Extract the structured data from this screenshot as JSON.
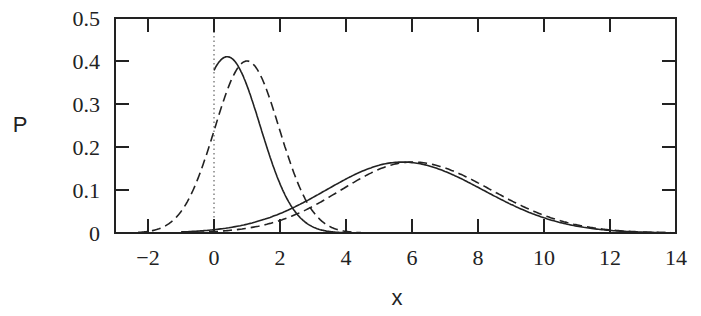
{
  "chart_data": {
    "type": "line",
    "title": "",
    "xlabel": "x",
    "ylabel": "P",
    "xlim": [
      -3,
      14
    ],
    "ylim": [
      0,
      0.5
    ],
    "grid": false,
    "legend": null,
    "x_ticks": [
      "-2",
      "0",
      "2",
      "4",
      "6",
      "8",
      "10",
      "12",
      "14"
    ],
    "y_ticks": [
      "0",
      "0.1",
      "0.2",
      "0.3",
      "0.4",
      "0.5"
    ],
    "vertical_reference_line": {
      "x": 0,
      "style": "dotted"
    },
    "series": [
      {
        "name": "solid-narrow",
        "style": "solid",
        "peak_x": 0.4,
        "peak_y": 0.41,
        "x": [
          0,
          0.4,
          1,
          2,
          3,
          4,
          5,
          6
        ],
        "y": [
          0.38,
          0.41,
          0.37,
          0.22,
          0.08,
          0.02,
          0.004,
          0.0
        ]
      },
      {
        "name": "dashed-narrow",
        "style": "dashed",
        "peak_x": 1.0,
        "peak_y": 0.4,
        "x": [
          -2,
          -1,
          0,
          1,
          2,
          3,
          4
        ],
        "y": [
          0.0,
          0.06,
          0.24,
          0.4,
          0.28,
          0.07,
          0.005
        ]
      },
      {
        "name": "solid-wide",
        "style": "solid",
        "peak_x": 5.7,
        "peak_y": 0.165,
        "x": [
          0,
          2,
          4,
          5.7,
          8,
          10,
          12,
          14
        ],
        "y": [
          0.005,
          0.05,
          0.13,
          0.165,
          0.12,
          0.05,
          0.012,
          0.0
        ]
      },
      {
        "name": "dashed-wide",
        "style": "dashed",
        "peak_x": 6.0,
        "peak_y": 0.165,
        "x": [
          -1,
          0,
          2,
          4,
          6,
          8,
          10,
          12,
          14
        ],
        "y": [
          0.0,
          0.003,
          0.04,
          0.12,
          0.165,
          0.13,
          0.05,
          0.01,
          0.0
        ]
      }
    ]
  }
}
